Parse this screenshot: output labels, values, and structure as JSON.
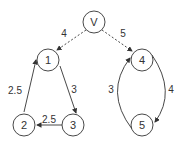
{
  "diagram": {
    "type": "directed-graph",
    "nodes": [
      {
        "id": "V",
        "label": "V"
      },
      {
        "id": "1",
        "label": "1"
      },
      {
        "id": "2",
        "label": "2"
      },
      {
        "id": "3",
        "label": "3"
      },
      {
        "id": "4",
        "label": "4"
      },
      {
        "id": "5",
        "label": "5"
      }
    ],
    "edges": [
      {
        "from": "V",
        "to": "1",
        "label": "4",
        "style": "dashed"
      },
      {
        "from": "V",
        "to": "4",
        "label": "5",
        "style": "dashed"
      },
      {
        "from": "1",
        "to": "3",
        "label": "3",
        "style": "solid"
      },
      {
        "from": "3",
        "to": "2",
        "label": "2.5",
        "style": "solid"
      },
      {
        "from": "2",
        "to": "1",
        "label": "2.5",
        "style": "solid"
      },
      {
        "from": "4",
        "to": "5",
        "label": "4",
        "style": "solid"
      },
      {
        "from": "5",
        "to": "4",
        "label": "3",
        "style": "solid"
      }
    ]
  }
}
